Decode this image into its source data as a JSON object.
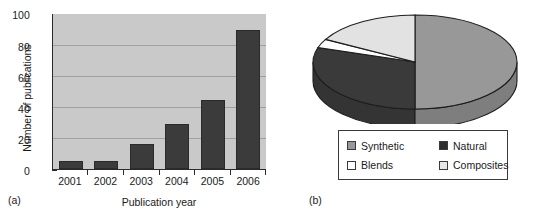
{
  "figure": {
    "panel_a_label": "(a)",
    "panel_b_label": "(b)"
  },
  "chart_data": [
    {
      "type": "bar",
      "panel": "(a)",
      "title": "",
      "xlabel": "Publication year",
      "ylabel": "Number of publications",
      "categories": [
        "2001",
        "2002",
        "2003",
        "2004",
        "2005",
        "2006"
      ],
      "values": [
        5,
        5,
        16,
        29,
        44,
        89
      ],
      "ylim": [
        0,
        100
      ],
      "yticks": [
        "0",
        "20",
        "40",
        "60",
        "80",
        "100"
      ],
      "ytick_values": [
        0,
        20,
        40,
        60,
        80,
        100
      ],
      "grid": true,
      "legend": "none",
      "plot_background": "#c9c9c9",
      "bar_color": "#3b3b3b"
    },
    {
      "type": "pie",
      "panel": "(b)",
      "title": "",
      "three_d": true,
      "labels": [
        "Synthetic",
        "Natural",
        "Blends",
        "Composites"
      ],
      "values": [
        50,
        30,
        3,
        17
      ],
      "colors": [
        "#989898",
        "#3a3a3a",
        "#fdfdfd",
        "#e2e2e2"
      ],
      "legend_position": "below",
      "legend": {
        "entries": [
          {
            "label": "Synthetic",
            "color": "#989898"
          },
          {
            "label": "Natural",
            "color": "#2e2e2e"
          },
          {
            "label": "Blends",
            "color": "#ffffff"
          },
          {
            "label": "Composites",
            "color": "#e6e6e6"
          }
        ]
      }
    }
  ]
}
